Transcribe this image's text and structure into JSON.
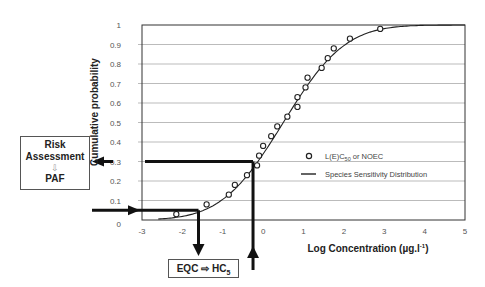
{
  "chart_data": {
    "type": "scatter",
    "title": "",
    "xlabel": "Log Concentration (µg.l⁻¹)",
    "ylabel": "Cumulative probability",
    "xlim": [
      -3,
      5
    ],
    "ylim": [
      0,
      1
    ],
    "x_ticks": [
      "-3",
      "-2",
      "-1",
      "0",
      "1",
      "2",
      "3",
      "4",
      "5"
    ],
    "y_ticks": [
      "0",
      "0.1",
      "0.2",
      "0.3",
      "0.4",
      "0.5",
      "0.6",
      "0.7",
      "0.8",
      "0.9",
      "1"
    ],
    "grid": "horizontal",
    "legend_position": "right-middle",
    "series": [
      {
        "name": "L(E)C50 or NOEC",
        "kind": "points",
        "points": [
          [
            -2.15,
            0.03
          ],
          [
            -1.4,
            0.08
          ],
          [
            -0.85,
            0.13
          ],
          [
            -0.7,
            0.18
          ],
          [
            -0.4,
            0.23
          ],
          [
            -0.15,
            0.28
          ],
          [
            -0.1,
            0.33
          ],
          [
            0.0,
            0.38
          ],
          [
            0.2,
            0.43
          ],
          [
            0.35,
            0.48
          ],
          [
            0.6,
            0.53
          ],
          [
            0.85,
            0.58
          ],
          [
            0.85,
            0.63
          ],
          [
            1.05,
            0.68
          ],
          [
            1.1,
            0.73
          ],
          [
            1.45,
            0.78
          ],
          [
            1.6,
            0.83
          ],
          [
            1.75,
            0.88
          ],
          [
            2.15,
            0.93
          ],
          [
            2.9,
            0.98
          ]
        ]
      },
      {
        "name": "Species Sensitivity Distribution",
        "kind": "curve",
        "distribution": "log-normal CDF",
        "mean": 0.5,
        "sd": 1.2
      }
    ],
    "annotations": {
      "hc5_line": {
        "y": 0.05,
        "x": -1.6,
        "label": "EQC ⇨ HC5"
      },
      "paf_line": {
        "x": -0.25,
        "y": 0.3,
        "label": "Risk Assessment ⇩ PAF"
      }
    }
  },
  "legend": {
    "points_label": "L(E)C",
    "points_sub": "50",
    "points_suffix": " or NOEC",
    "curve_label": "Species Sensitivity Distribution"
  },
  "axes": {
    "ylabel": "Cumulative probability",
    "xlabel_main": "Log Concentration (µg.l",
    "xlabel_sup": "-1",
    "xlabel_end": ")"
  },
  "boxes": {
    "risk": {
      "line1": "Risk",
      "line2": "Assessment",
      "arrow": "⇩",
      "line3": "PAF"
    },
    "eqc": {
      "main": "EQC ⇨ HC",
      "sub": "5"
    }
  }
}
